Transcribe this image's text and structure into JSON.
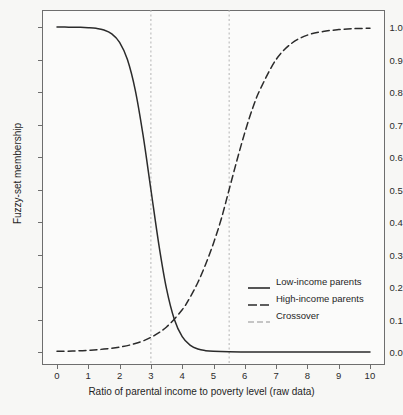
{
  "chart_data": {
    "type": "line",
    "title": "",
    "xlabel": "Ratio of parental income to poverty level (raw data)",
    "ylabel": "Fuzzy-set membership",
    "xlim": [
      0,
      10
    ],
    "ylim": [
      0,
      1
    ],
    "grid": false,
    "legend_position": "lower-right inside axes",
    "xticks": [
      "0",
      "1",
      "2",
      "3",
      "4",
      "5",
      "6",
      "7",
      "8",
      "9",
      "10"
    ],
    "yticks": [
      "0.0",
      "0.1",
      "0.2",
      "0.3",
      "0.4",
      "0.5",
      "0.6",
      "0.7",
      "0.8",
      "0.9",
      "1.0"
    ],
    "annotations": {
      "crossover_lines_x": [
        3,
        5.5
      ],
      "crossover_note": "Vertical dotted grey reference lines mark the two crossover points where each fuzzy set equals 0.5 membership."
    },
    "series": [
      {
        "name": "Low-income parents",
        "style": "solid",
        "color": "#2b2b2b",
        "x": [
          0,
          0.25,
          0.5,
          0.75,
          1,
          1.25,
          1.5,
          1.75,
          2,
          2.25,
          2.5,
          2.75,
          3,
          3.25,
          3.5,
          3.75,
          4,
          4.25,
          4.5,
          4.75,
          5,
          5.5,
          6,
          6.5,
          7,
          7.5,
          8,
          8.5,
          9,
          9.5,
          10
        ],
        "y": [
          1.0,
          1.0,
          0.999,
          0.999,
          0.998,
          0.996,
          0.991,
          0.979,
          0.953,
          0.9,
          0.806,
          0.667,
          0.5,
          0.333,
          0.194,
          0.1,
          0.047,
          0.021,
          0.009,
          0.004,
          0.002,
          0.0004,
          0.0001,
          0.0,
          0.0,
          0.0,
          0.0,
          0.0,
          0.0,
          0.0,
          0.0
        ]
      },
      {
        "name": "High-income parents",
        "style": "dashed",
        "color": "#2b2b2b",
        "x": [
          0,
          0.5,
          1,
          1.5,
          2,
          2.5,
          3,
          3.5,
          4,
          4.25,
          4.5,
          4.75,
          5,
          5.25,
          5.5,
          5.75,
          6,
          6.25,
          6.5,
          7,
          7.5,
          8,
          8.5,
          9,
          9.5,
          10
        ],
        "y": [
          0.002,
          0.003,
          0.005,
          0.009,
          0.015,
          0.026,
          0.045,
          0.077,
          0.13,
          0.168,
          0.214,
          0.27,
          0.335,
          0.41,
          0.5,
          0.59,
          0.675,
          0.75,
          0.81,
          0.9,
          0.95,
          0.975,
          0.986,
          0.992,
          0.995,
          0.996
        ]
      },
      {
        "name": "Crossover",
        "style": "dashed-grey",
        "color": "#b4b4b4",
        "x": [
          3,
          5.5
        ],
        "y": [
          null,
          null
        ]
      }
    ]
  },
  "axes": {
    "ylabel": "Fuzzy-set membership",
    "xlabel": "Ratio of parental income to poverty level (raw data)",
    "ytick_labels": [
      "1.0",
      "0.9",
      "0.8",
      "0.7",
      "0.6",
      "0.5",
      "0.4",
      "0.3",
      "0.2",
      "0.1",
      "0.0"
    ],
    "xtick_labels": [
      "0",
      "1",
      "2",
      "3",
      "4",
      "5",
      "6",
      "7",
      "8",
      "9",
      "10"
    ]
  },
  "legend": {
    "items": [
      {
        "label": "Low-income parents",
        "style": "solid"
      },
      {
        "label": "High-income parents",
        "style": "dashed"
      },
      {
        "label": "Crossover",
        "style": "dashed-grey"
      }
    ]
  },
  "colors": {
    "curve": "#2b2b2b",
    "crossover": "#b4b4b4",
    "frame": "#6e6e6e",
    "background": "#f7f7f5"
  }
}
